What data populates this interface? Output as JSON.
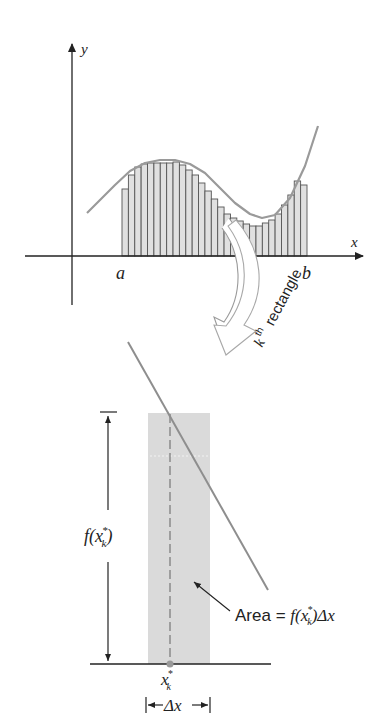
{
  "upper_graph": {
    "y_axis_label": "y",
    "x_axis_label": "x",
    "a_label": "a",
    "b_label": "b",
    "rect_count": 29,
    "rect_x_start": 122,
    "rect_x_end": 307,
    "baseline_y": 256,
    "rect_tops": [
      189,
      175,
      167,
      164,
      163,
      163,
      163,
      163,
      162,
      165,
      170,
      175,
      183,
      191,
      199,
      207,
      214,
      218,
      221,
      224,
      226,
      226,
      223,
      220,
      214,
      205,
      195,
      181,
      185
    ],
    "curve_points": [
      [
        87,
        213
      ],
      [
        100,
        200
      ],
      [
        115,
        185
      ],
      [
        130,
        171
      ],
      [
        145,
        163
      ],
      [
        160,
        160
      ],
      [
        175,
        160
      ],
      [
        190,
        164
      ],
      [
        205,
        173
      ],
      [
        220,
        188
      ],
      [
        235,
        203
      ],
      [
        250,
        214
      ],
      [
        262,
        218
      ],
      [
        275,
        215
      ],
      [
        290,
        198
      ],
      [
        305,
        166
      ],
      [
        318,
        126
      ]
    ],
    "colors": {
      "bar_fill": "#e0e0e0",
      "bar_stroke": "#555555",
      "curve": "#9a9a9a",
      "axis": "#222222"
    }
  },
  "callout": {
    "label_superscript": "th",
    "label_k": "k",
    "label_text": "rectangle"
  },
  "lower_graph": {
    "f_label": "f(x",
    "f_label_sub": "k",
    "f_label_sup": "*",
    "f_label_close": ")",
    "area_label_prefix": "Area = ",
    "area_label_formula": "f(x",
    "area_label_sub": "k",
    "area_label_sup": "*",
    "area_label_suffix": ")Δx",
    "xk_label": "x",
    "xk_sub": "k",
    "xk_sup": "*",
    "delta_x_label": "Δx",
    "colors": {
      "rect_fill": "#d9d9d9",
      "curve": "#8e8e8e",
      "dash": "#777777",
      "point": "#9a9a9a"
    }
  }
}
